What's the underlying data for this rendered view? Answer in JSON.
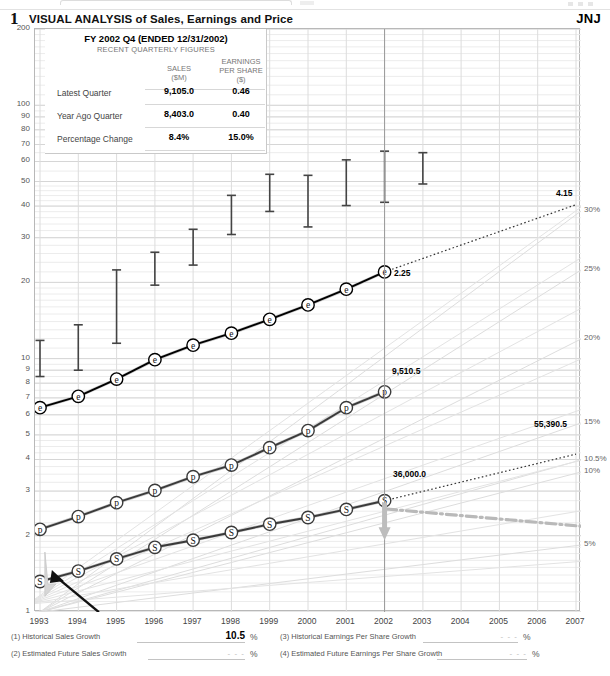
{
  "header": {
    "number": "1",
    "title": "VISUAL ANALYSIS of Sales, Earnings and Price",
    "ticker": "JNJ"
  },
  "quarterly_panel": {
    "title": "FY 2002 Q4 (ENDED 12/31/2002)",
    "subtitle": "RECENT QUARTERLY FIGURES",
    "col_sales": "SALES",
    "col_sales_unit": "($M)",
    "col_eps": "EARNINGS",
    "col_eps_2": "PER SHARE",
    "col_eps_unit": "($)",
    "rows": [
      {
        "label": "Latest Quarter",
        "sales": "9,105.0",
        "eps": "0.46"
      },
      {
        "label": "Year Ago Quarter",
        "sales": "8,403.0",
        "eps": "0.40"
      },
      {
        "label": "Percentage Change",
        "sales": "8.4%",
        "eps": "15.0%"
      }
    ]
  },
  "footer": {
    "items": [
      {
        "id": "historical-sales-growth",
        "label": "(1) Historical Sales Growth",
        "value": "10.5",
        "unit": "%"
      },
      {
        "id": "estimated-future-sales-growth",
        "label": "(2) Estimated Future Sales Growth",
        "value": "- - -",
        "unit": "%"
      },
      {
        "id": "historical-eps-growth",
        "label": "(3) Historical Earnings Per Share Growth",
        "value": "- - -",
        "unit": "%"
      },
      {
        "id": "estimated-future-eps-growth",
        "label": "(4) Estimated Future Earnings Per Share Growth",
        "value": "- - -",
        "unit": "%"
      }
    ]
  },
  "chart_data": {
    "type": "line",
    "title": "VISUAL ANALYSIS of Sales, Earnings and Price",
    "subtitle": "JNJ",
    "xlabel": "",
    "ylabel": "",
    "yscale": "log",
    "ylim": [
      1,
      200
    ],
    "grid": true,
    "legend": "none",
    "x": [
      1993,
      1994,
      1995,
      1996,
      1997,
      1998,
      1999,
      2000,
      2001,
      2002,
      2003,
      2004,
      2005,
      2006,
      2007
    ],
    "xticklabels": [
      "1993",
      "1994",
      "1995",
      "1996",
      "1997",
      "1998",
      "1999",
      "2000",
      "2001",
      "2002",
      "2003",
      "2004",
      "2005",
      "2006",
      "2007"
    ],
    "yticklabels_left": [
      "200",
      "100",
      "90",
      "80",
      "70",
      "60",
      "50",
      "40",
      "30",
      "20",
      "10",
      "9",
      "8",
      "7",
      "6",
      "5",
      "4",
      "3",
      "2",
      "1"
    ],
    "yticks_left": [
      200,
      100,
      90,
      80,
      70,
      60,
      50,
      40,
      30,
      20,
      10,
      9,
      8,
      7,
      6,
      5,
      4,
      3,
      2,
      1
    ],
    "yticklabels_right": [
      "30%",
      "25%",
      "20%",
      "15%",
      "10.5%",
      "10%",
      "5%"
    ],
    "series": [
      {
        "name": "Sales",
        "marker": "S",
        "color": "#3a3a3a",
        "x": [
          1993,
          1994,
          1995,
          1996,
          1997,
          1998,
          1999,
          2000,
          2001,
          2002
        ],
        "values": [
          14138,
          15734,
          18842,
          21620,
          22629,
          23657,
          27471,
          29172,
          32317,
          36000
        ],
        "plot_units": "scaled to left log axis",
        "plot_values": [
          1.32,
          1.45,
          1.62,
          1.8,
          1.92,
          2.06,
          2.22,
          2.36,
          2.54,
          2.75
        ],
        "end_label": "36,000.0"
      },
      {
        "name": "Pre-tax Profit",
        "marker": "p",
        "color": "#3a3a3a",
        "x": [
          1993,
          1994,
          1995,
          1996,
          1997,
          1998,
          1999,
          2000,
          2001,
          2002
        ],
        "values": [
          2100,
          2500,
          3000,
          3450,
          3900,
          4200,
          5500,
          6700,
          8300,
          9510.5
        ],
        "plot_units": "scaled to left log axis",
        "plot_values": [
          2.12,
          2.38,
          2.7,
          3.02,
          3.42,
          3.8,
          4.45,
          5.2,
          6.4,
          7.4
        ],
        "end_label": "9,510.5"
      },
      {
        "name": "Earnings Per Share",
        "marker": "e",
        "color": "#000000",
        "x": [
          1993,
          1994,
          1995,
          1996,
          1997,
          1998,
          1999,
          2000,
          2001,
          2002
        ],
        "values": [
          0.69,
          0.78,
          0.93,
          1.09,
          1.21,
          1.34,
          1.49,
          1.7,
          1.91,
          2.25
        ],
        "plot_units": "scaled to left log axis",
        "plot_values": [
          6.4,
          7.1,
          8.3,
          9.9,
          11.3,
          12.6,
          14.3,
          16.3,
          18.8,
          22.0
        ],
        "end_label": "2.25"
      }
    ],
    "projections": [
      {
        "name": "Earnings Per Share projection",
        "style": "dotted",
        "from_x": 2002,
        "to_x": 2007,
        "label": "4.15"
      },
      {
        "name": "Sales projection",
        "style": "dotted",
        "from_x": 2002,
        "to_x": 2007,
        "label": "55,390.5"
      }
    ],
    "price_bars": {
      "name": "Annual Price Range",
      "color": "#444444",
      "x": [
        1993,
        1994,
        1995,
        1996,
        1997,
        1998,
        1999,
        2000,
        2001,
        2002,
        2003
      ],
      "high": [
        11.8,
        13.6,
        22.4,
        26.3,
        32.4,
        44.1,
        53.4,
        52.9,
        60.9,
        65.9,
        65.0
      ],
      "low": [
        8.5,
        9.0,
        11.5,
        19.5,
        23.4,
        30.9,
        38.1,
        33.1,
        40.2,
        41.4,
        48.9
      ]
    },
    "annotations": [
      {
        "text": "2.25",
        "kind": "series-end-label",
        "series": "Earnings Per Share"
      },
      {
        "text": "9,510.5",
        "kind": "series-end-label",
        "series": "Pre-tax Profit"
      },
      {
        "text": "36,000.0",
        "kind": "series-end-label",
        "series": "Sales"
      },
      {
        "text": "4.15",
        "kind": "projection-label",
        "series": "Earnings Per Share"
      },
      {
        "text": "55,390.5",
        "kind": "projection-label",
        "series": "Sales"
      }
    ]
  }
}
